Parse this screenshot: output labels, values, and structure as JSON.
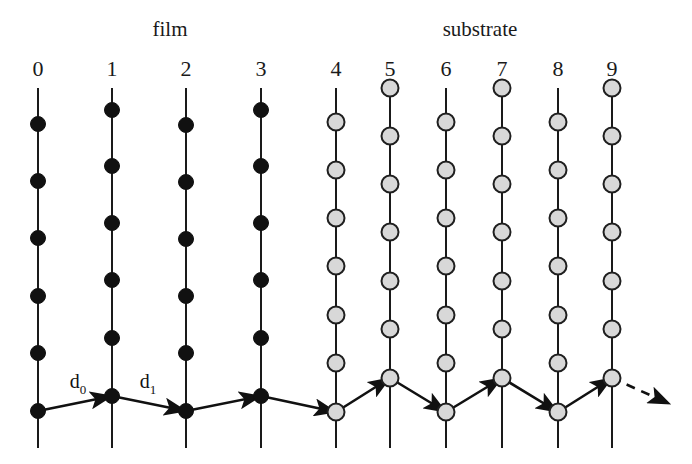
{
  "figure": {
    "title_film": "film",
    "title_substrate": "substrate",
    "region_labels": [
      {
        "text": "film",
        "x": 170,
        "y": 36
      },
      {
        "text": "substrate",
        "x": 480,
        "y": 36
      }
    ],
    "column_numbers": [
      "0",
      "1",
      "2",
      "3",
      "4",
      "5",
      "6",
      "7",
      "8",
      "9"
    ],
    "spacing_labels": [
      {
        "symbol": "d",
        "subscript": "0",
        "x": 78,
        "y": 388
      },
      {
        "symbol": "d",
        "subscript": "1",
        "x": 148,
        "y": 388
      }
    ],
    "colors": {
      "film_atom": "#111111",
      "substrate_atom": "#d8d8d8",
      "atom_outline": "#1f1f1f",
      "line": "#1a1a1a",
      "bond": "#111111",
      "background": "#ffffff",
      "text": "#1a1a1a"
    },
    "geometry": {
      "width": 692,
      "height": 464,
      "line_top_y": 88,
      "line_bottom_y": 448,
      "label_number_y": 76,
      "film_atom_radius": 7.5,
      "substrate_atom_radius": 8.5
    },
    "columns": [
      {
        "index": 0,
        "label": "0",
        "x": 38,
        "type": "film",
        "parity": "even",
        "atom_ys": [
          124,
          181,
          238,
          296,
          353,
          411
        ]
      },
      {
        "index": 1,
        "label": "1",
        "x": 112,
        "type": "film",
        "parity": "odd",
        "atom_ys": [
          110,
          166,
          223,
          280,
          338,
          396
        ]
      },
      {
        "index": 2,
        "label": "2",
        "x": 186,
        "type": "film",
        "parity": "even",
        "atom_ys": [
          125,
          182,
          239,
          296,
          353,
          411
        ]
      },
      {
        "index": 3,
        "label": "3",
        "x": 261,
        "type": "film",
        "parity": "odd",
        "atom_ys": [
          110,
          166,
          223,
          280,
          338,
          396
        ]
      },
      {
        "index": 4,
        "label": "4",
        "x": 336,
        "type": "substrate",
        "parity": "even",
        "atom_ys": [
          122,
          170,
          218,
          266,
          315,
          363,
          412
        ]
      },
      {
        "index": 5,
        "label": "5",
        "x": 390,
        "type": "substrate",
        "parity": "odd",
        "atom_ys": [
          88,
          136,
          184,
          232,
          281,
          329,
          378
        ]
      },
      {
        "index": 6,
        "label": "6",
        "x": 446,
        "type": "substrate",
        "parity": "even",
        "atom_ys": [
          122,
          170,
          218,
          266,
          315,
          363,
          412
        ]
      },
      {
        "index": 7,
        "label": "7",
        "x": 502,
        "type": "substrate",
        "parity": "odd",
        "atom_ys": [
          88,
          136,
          184,
          232,
          281,
          329,
          378
        ]
      },
      {
        "index": 8,
        "label": "8",
        "x": 558,
        "type": "substrate",
        "parity": "even",
        "atom_ys": [
          122,
          170,
          218,
          266,
          315,
          363,
          412
        ]
      },
      {
        "index": 9,
        "label": "9",
        "x": 612,
        "type": "substrate",
        "parity": "odd",
        "atom_ys": [
          88,
          136,
          184,
          232,
          281,
          329,
          378
        ]
      }
    ],
    "zigzag": {
      "points": [
        {
          "x": 38,
          "y": 411
        },
        {
          "x": 112,
          "y": 396
        },
        {
          "x": 186,
          "y": 411
        },
        {
          "x": 261,
          "y": 396
        },
        {
          "x": 336,
          "y": 412
        },
        {
          "x": 390,
          "y": 378
        },
        {
          "x": 446,
          "y": 412
        },
        {
          "x": 502,
          "y": 378
        },
        {
          "x": 558,
          "y": 412
        },
        {
          "x": 612,
          "y": 378
        }
      ],
      "arrow_segments": [
        0,
        1,
        2,
        3,
        4,
        5,
        6,
        7,
        8
      ],
      "dashed_tail": {
        "x1": 612,
        "y1": 378,
        "x2": 670,
        "y2": 404
      }
    }
  }
}
